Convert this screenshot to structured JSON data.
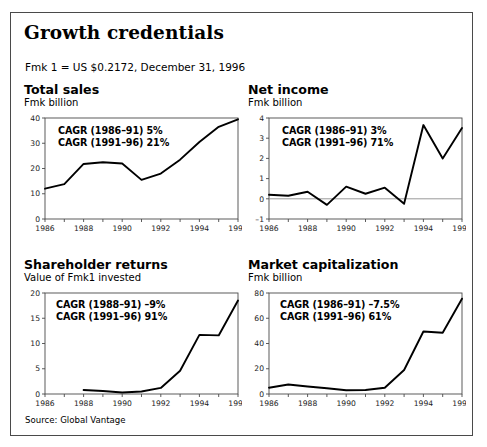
{
  "figure": {
    "title": "Growth credentials",
    "fx_note": "Fmk 1 = US $0.2172, December 31, 1996",
    "source": "Source: Global Vantage",
    "line_color": "#000000",
    "frame_color": "#4a4a4a",
    "zero_line_color": "#808080"
  },
  "chart_data": [
    {
      "type": "line",
      "id": "total-sales",
      "title": "Total sales",
      "subtitle": "Fmk billion",
      "ylabel": "Fmk billion",
      "xlabel": "",
      "x": [
        1986,
        1987,
        1988,
        1989,
        1990,
        1991,
        1992,
        1993,
        1994,
        1995,
        1996
      ],
      "values": [
        12.0,
        13.8,
        21.8,
        22.5,
        22.0,
        15.5,
        18.0,
        23.5,
        30.5,
        36.5,
        39.5
      ],
      "xlim": [
        1986,
        1996
      ],
      "ylim": [
        0,
        40
      ],
      "yticks": [
        0,
        10,
        20,
        30,
        40
      ],
      "ytick_labels": [
        "0",
        "10",
        "20",
        "30",
        "40"
      ],
      "xticks": [
        1986,
        1987,
        1988,
        1989,
        1990,
        1991,
        1992,
        1993,
        1994,
        1995,
        1996
      ],
      "xtick_labels": [
        "1986",
        "",
        "1988",
        "",
        "1990",
        "",
        "1992",
        "",
        "1994",
        "",
        "1996"
      ],
      "grid": false,
      "zero_line": false,
      "annotations": [
        "CAGR (1986–91) 5%",
        "CAGR (1991–96) 21%"
      ]
    },
    {
      "type": "line",
      "id": "net-income",
      "title": "Net income",
      "subtitle": "Fmk billion",
      "ylabel": "Fmk billion",
      "xlabel": "",
      "x": [
        1986,
        1987,
        1988,
        1989,
        1990,
        1991,
        1992,
        1993,
        1994,
        1995,
        1996
      ],
      "values": [
        0.2,
        0.15,
        0.35,
        -0.3,
        0.6,
        0.25,
        0.55,
        -0.25,
        3.65,
        2.0,
        3.5
      ],
      "xlim": [
        1986,
        1996
      ],
      "ylim": [
        -1,
        4
      ],
      "yticks": [
        -1,
        0,
        1,
        2,
        3,
        4
      ],
      "ytick_labels": [
        "–1",
        "0",
        "1",
        "2",
        "3",
        "4"
      ],
      "xticks": [
        1986,
        1987,
        1988,
        1989,
        1990,
        1991,
        1992,
        1993,
        1994,
        1995,
        1996
      ],
      "xtick_labels": [
        "1986",
        "",
        "1988",
        "",
        "1990",
        "",
        "1992",
        "",
        "1994",
        "",
        "1996"
      ],
      "grid": false,
      "zero_line": true,
      "annotations": [
        "CAGR (1986–91) 3%",
        "CAGR (1991–96) 71%"
      ]
    },
    {
      "type": "line",
      "id": "shareholder-returns",
      "title": "Shareholder returns",
      "subtitle": "Value of Fmk1 invested",
      "ylabel": "Value of Fmk1 invested",
      "xlabel": "",
      "x": [
        1988,
        1989,
        1990,
        1991,
        1992,
        1993,
        1994,
        1995,
        1996
      ],
      "values": [
        0.8,
        0.6,
        0.3,
        0.5,
        1.2,
        4.6,
        11.7,
        11.6,
        18.5
      ],
      "xlim": [
        1986,
        1996
      ],
      "ylim": [
        0,
        20
      ],
      "yticks": [
        0,
        5,
        10,
        15,
        20
      ],
      "ytick_labels": [
        "0",
        "5",
        "10",
        "15",
        "20"
      ],
      "xticks": [
        1986,
        1987,
        1988,
        1989,
        1990,
        1991,
        1992,
        1993,
        1994,
        1995,
        1996
      ],
      "xtick_labels": [
        "1986",
        "",
        "1988",
        "",
        "1990",
        "",
        "1992",
        "",
        "1994",
        "",
        "1996"
      ],
      "grid": false,
      "zero_line": false,
      "annotations": [
        "CAGR (1988–91) –9%",
        "CAGR (1991–96) 91%"
      ]
    },
    {
      "type": "line",
      "id": "market-capitalization",
      "title": "Market capitalization",
      "subtitle": "Fmk billion",
      "ylabel": "Fmk billion",
      "xlabel": "",
      "x": [
        1986,
        1987,
        1988,
        1989,
        1990,
        1991,
        1992,
        1993,
        1994,
        1995,
        1996
      ],
      "values": [
        5.0,
        7.5,
        6.0,
        4.5,
        3.0,
        3.2,
        5.0,
        19.0,
        49.5,
        48.5,
        75.5
      ],
      "xlim": [
        1986,
        1996
      ],
      "ylim": [
        0,
        80
      ],
      "yticks": [
        0,
        20,
        40,
        60,
        80
      ],
      "ytick_labels": [
        "0",
        "20",
        "40",
        "60",
        "80"
      ],
      "xticks": [
        1986,
        1987,
        1988,
        1989,
        1990,
        1991,
        1992,
        1993,
        1994,
        1995,
        1996
      ],
      "xtick_labels": [
        "1986",
        "",
        "1988",
        "",
        "1990",
        "",
        "1992",
        "",
        "1994",
        "",
        "1996"
      ],
      "grid": false,
      "zero_line": false,
      "annotations": [
        "CAGR (1986–91) –7.5%",
        "CAGR (1991–96) 61%"
      ]
    }
  ]
}
